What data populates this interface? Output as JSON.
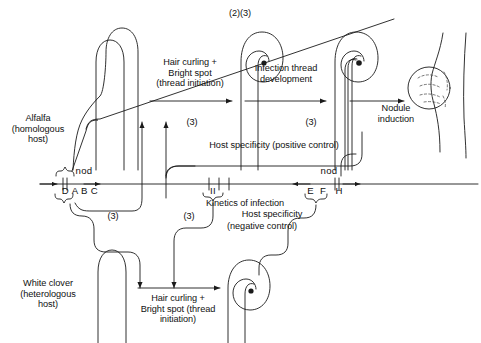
{
  "diagram": {
    "title_top": "(2)(3)",
    "organisms": {
      "top_host": "Alfalfa\n(homologous\nhost)",
      "bottom_host": "White clover\n(heterologous\nhost)"
    },
    "top_pathway": {
      "step1": "Hair curling +\nBright spot\n(thread initiation)",
      "step2": "Infection thread\ndevelopment",
      "step3": "Nodule\ninduction"
    },
    "bottom_pathway": {
      "step1": "Hair curling +\nBright spot (thread\ninitiation)"
    },
    "annotations": {
      "positive_control": "Host specificity (positive control)",
      "kinetics": "Kinetics of infection",
      "host_specificity": "Host specificity",
      "negative_control": "(negative control)"
    },
    "refs": {
      "r1": "(3)",
      "r2": "(3)",
      "r3": "(3)",
      "r4": "(3)",
      "r5": "(3)",
      "r6": "(3)"
    },
    "gene_map": {
      "left_cluster": {
        "operon_label": "nod",
        "genes": [
          "D",
          "A",
          "B",
          "C"
        ],
        "genes_text": "D A B C"
      },
      "middle_cluster": {
        "operon_label": "II",
        "tick_count": 3
      },
      "right_cluster": {
        "operon_label": "nod",
        "genes": [
          "E",
          "F",
          "H"
        ],
        "genes_text": "E  F   H"
      }
    },
    "colors": {
      "line": "#1a1a1a",
      "background": "#ffffff",
      "text": "#111111"
    }
  }
}
